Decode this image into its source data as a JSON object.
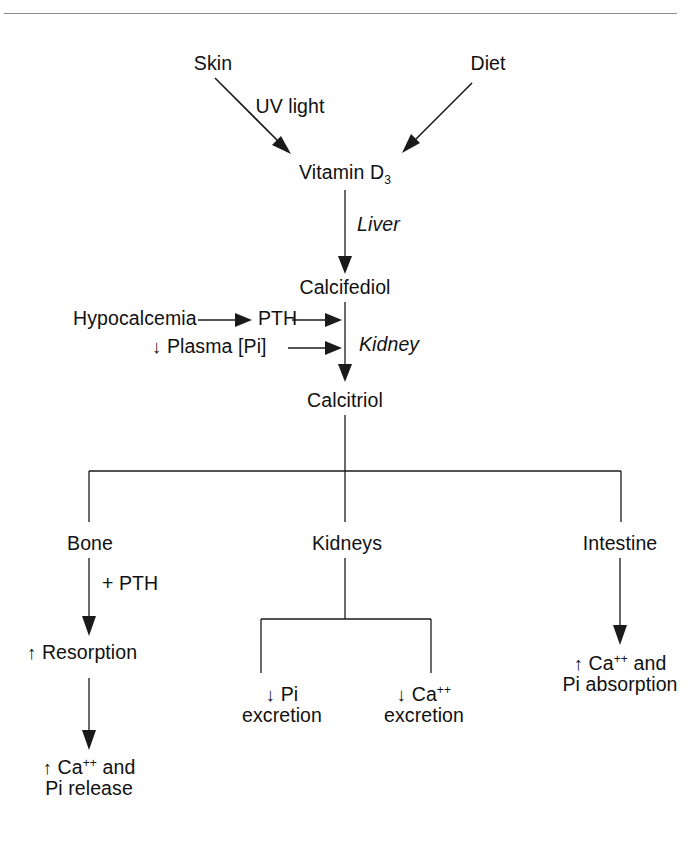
{
  "diagram": {
    "line_color": "#1a1a1a",
    "rule_color": "#8a8a8a",
    "background": "#ffffff",
    "text_color": "#111111"
  },
  "nodes": {
    "skin": "Skin",
    "diet": "Diet",
    "uv_light": "UV light",
    "vitamin_d3_main": "Vitamin D",
    "vitamin_d3_sub": "3",
    "liver": "Liver",
    "calcifediol": "Calcifediol",
    "hypocalcemia": "Hypocalcemia",
    "pth": "PTH",
    "plasma_pi": "Plasma [Pi]",
    "plasma_pi_arrow": "↓",
    "kidney": "Kidney",
    "calcitriol": "Calcitriol",
    "bone": "Bone",
    "kidneys": "Kidneys",
    "intestine": "Intestine",
    "plus_pth": "+ PTH",
    "resorption_arrow": "↑",
    "resorption": "Resorption",
    "bone_out_arrow": "↑",
    "bone_out_line1_pre": "Ca",
    "bone_out_line1_sup": "++",
    "bone_out_line1_post": " and",
    "bone_out_line2": "Pi release",
    "pi_excretion_arrow": "↓",
    "pi_excretion_line1": "Pi",
    "pi_excretion_line2": "excretion",
    "ca_excretion_arrow": "↓",
    "ca_excretion_line1_pre": "Ca",
    "ca_excretion_line1_sup": "++",
    "ca_excretion_line2": "excretion",
    "intestine_out_arrow": "↑",
    "intestine_out_line1_pre": "Ca",
    "intestine_out_line1_sup": "++",
    "intestine_out_line1_post": " and",
    "intestine_out_line2": "Pi absorption"
  }
}
